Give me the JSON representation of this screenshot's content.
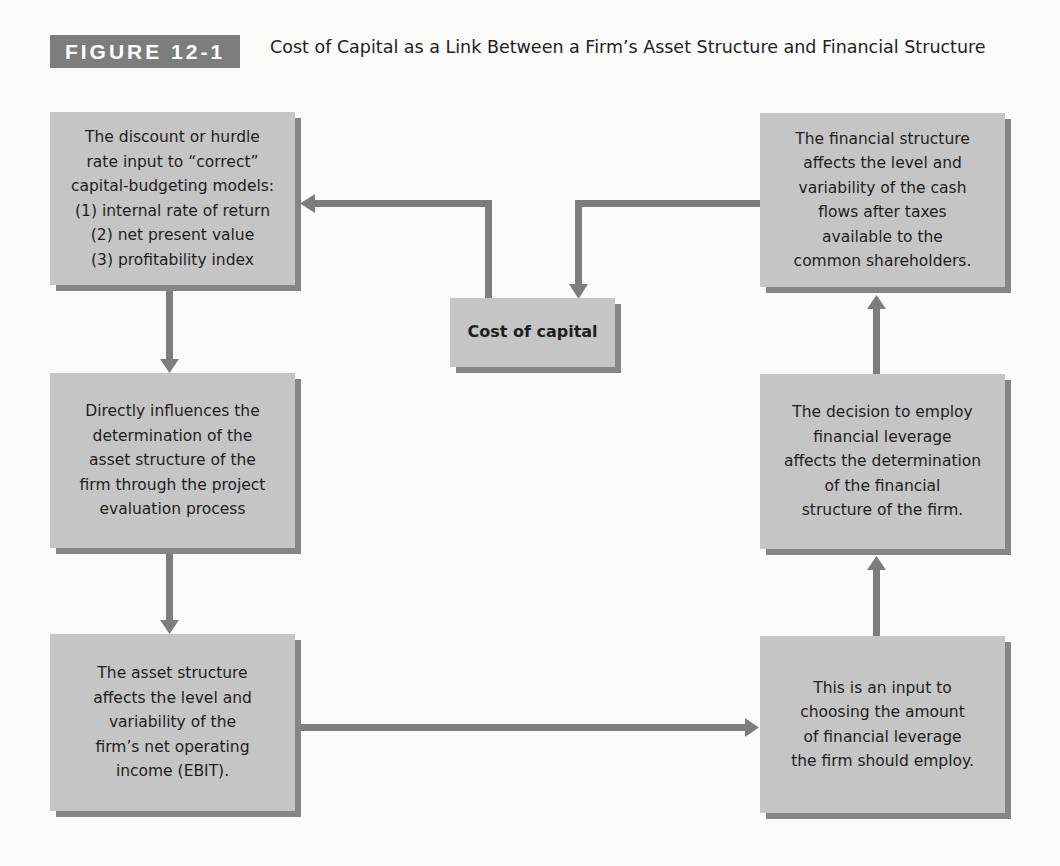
{
  "figure": {
    "label": "FIGURE 12-1",
    "title": "Cost of Capital as a Link Between a Firm’s Asset Structure and Financial Structure"
  },
  "colors": {
    "box_fill": "#c5c5c5",
    "box_shadow": "#858585",
    "arrow": "#7d7d7d",
    "label_bg": "#7d7d7d",
    "background": "#fbfbfa"
  },
  "boxes": {
    "hurdle_rate": {
      "lines": [
        "The discount or hurdle",
        "rate input to “correct”",
        "capital-budgeting models:",
        "(1) internal rate of return",
        "(2) net present value",
        "(3) profitability index"
      ]
    },
    "asset_structure_determination": {
      "lines": [
        "Directly influences the",
        "determination of the",
        "asset structure of the",
        "firm through the project",
        "evaluation process"
      ]
    },
    "asset_structure_effect": {
      "lines": [
        "The asset structure",
        "affects the level and",
        "variability of the",
        "firm’s net operating",
        "income (EBIT)."
      ]
    },
    "cost_of_capital": {
      "label": "Cost of capital"
    },
    "financial_structure_effect": {
      "lines": [
        "The financial structure",
        "affects the level and",
        "variability of the cash",
        "flows after taxes",
        "available to the",
        "common shareholders."
      ]
    },
    "leverage_decision": {
      "lines": [
        "The decision to employ",
        "financial leverage",
        "affects the determination",
        "of the financial",
        "structure of the firm."
      ]
    },
    "leverage_input": {
      "lines": [
        "This is an input to",
        "choosing the amount",
        "of financial leverage",
        "the firm should employ."
      ]
    }
  },
  "flow": [
    {
      "from": "cost_of_capital",
      "to": "hurdle_rate"
    },
    {
      "from": "hurdle_rate",
      "to": "asset_structure_determination"
    },
    {
      "from": "asset_structure_determination",
      "to": "asset_structure_effect"
    },
    {
      "from": "asset_structure_effect",
      "to": "leverage_input"
    },
    {
      "from": "leverage_input",
      "to": "leverage_decision"
    },
    {
      "from": "leverage_decision",
      "to": "financial_structure_effect"
    },
    {
      "from": "financial_structure_effect",
      "to": "cost_of_capital"
    }
  ]
}
